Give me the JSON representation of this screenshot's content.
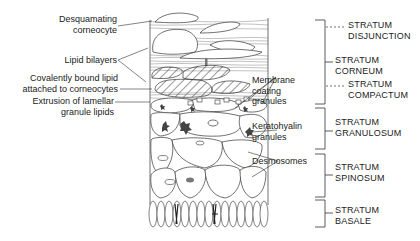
{
  "figure": {
    "type": "epidermis-cross-section",
    "left_labels": [
      {
        "id": "desquamating",
        "lines": [
          "Desquamating",
          "corneocyte"
        ]
      },
      {
        "id": "lipid-bilayers",
        "lines": [
          "Lipid bilayers"
        ]
      },
      {
        "id": "bound-lipid",
        "lines": [
          "Covalently bound lipid",
          "attached to corneocytes"
        ]
      },
      {
        "id": "extrusion",
        "lines": [
          "Extrusion of lamellar",
          "granule lipids"
        ]
      }
    ],
    "middle_labels": [
      {
        "id": "membrane-coating",
        "lines": [
          "Membrane",
          "coating",
          "granules"
        ]
      },
      {
        "id": "keratohyalin",
        "lines": [
          "Keratohyalin",
          "granules"
        ]
      },
      {
        "id": "desmosomes",
        "lines": [
          "Desmosomes"
        ]
      }
    ],
    "strata": [
      {
        "id": "disjunction",
        "lines": [
          "STRATUM",
          "DISJUNCTION"
        ],
        "style": "dashed"
      },
      {
        "id": "corneum",
        "lines": [
          "STRATUM",
          "CORNEUM"
        ],
        "style": "solid"
      },
      {
        "id": "compactum",
        "lines": [
          "STRATUM",
          "COMPACTUM"
        ],
        "style": "dashed"
      },
      {
        "id": "granulosum",
        "lines": [
          "STRATUM",
          "GRANULOSUM"
        ],
        "style": "solid"
      },
      {
        "id": "spinosum",
        "lines": [
          "STRATUM",
          "SPINOSUM"
        ],
        "style": "solid"
      },
      {
        "id": "basale",
        "lines": [
          "STRATUM",
          "BASALE"
        ],
        "style": "solid"
      }
    ],
    "colors": {
      "line": "#333333",
      "text": "#222222",
      "background": "#ffffff",
      "granule": "#555555"
    }
  }
}
